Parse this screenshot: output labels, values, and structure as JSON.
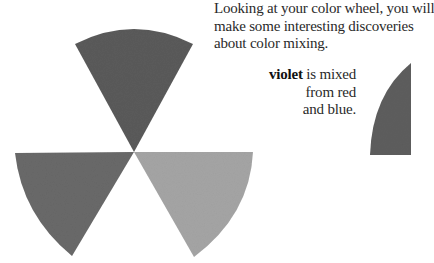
{
  "intro": {
    "lines": [
      "Looking at your color wheel, you will",
      "make some interesting discoveries",
      "about color mixing."
    ]
  },
  "caption": {
    "bold": "violet",
    "line1_rest": " is mixed",
    "line2": "from red",
    "line3": "and blue."
  },
  "wedges": [
    {
      "name": "top",
      "color": "#5c5c5c"
    },
    {
      "name": "bottom-left",
      "color": "#6a6a6a"
    },
    {
      "name": "bottom-right",
      "color": "#a6a6a6"
    },
    {
      "name": "violet-partial",
      "color": "#5e5e5e"
    }
  ]
}
